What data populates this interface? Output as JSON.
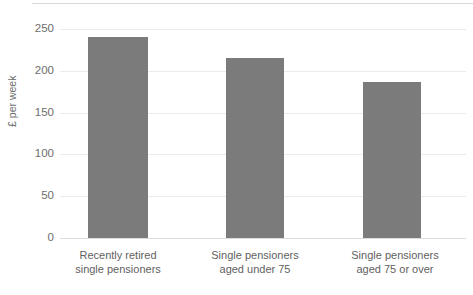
{
  "chart_data": {
    "type": "bar",
    "title": "",
    "subtitle": "",
    "xlabel": "",
    "ylabel": "£ per week",
    "ylim": [
      0,
      250
    ],
    "yticks": [
      0,
      50,
      100,
      150,
      200,
      250
    ],
    "ytick_labels": [
      "0",
      "50",
      "100",
      "150",
      "200",
      "250"
    ],
    "grid": true,
    "legend": null,
    "bar_color": "#7b7b7b",
    "gridline_color": "#ebebeb",
    "background_color": "#ffffff",
    "categories": [
      "Recently retired single pensioners",
      "Single pensioners aged under 75",
      "Single pensioners aged 75 or over"
    ],
    "category_lines": [
      [
        "Recently retired",
        "single pensioners"
      ],
      [
        "Single pensioners",
        "aged under 75"
      ],
      [
        "Single pensioners",
        "aged 75 or over"
      ]
    ],
    "values": [
      240,
      215,
      187
    ],
    "bars": [
      {
        "label_line1": "Recently retired",
        "label_line2": "single pensioners",
        "value": 240
      },
      {
        "label_line1": "Single pensioners",
        "label_line2": "aged under 75",
        "value": 215
      },
      {
        "label_line1": "Single pensioners",
        "label_line2": "aged 75 or over",
        "value": 187
      }
    ]
  }
}
